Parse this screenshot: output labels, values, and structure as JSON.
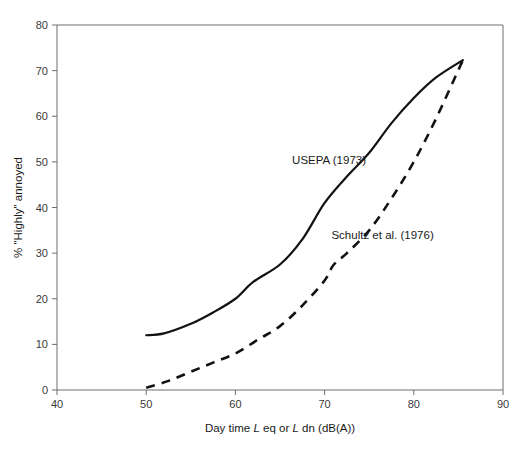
{
  "chart_data": {
    "type": "line",
    "title": "",
    "xlabel": "Day time L eq or L dn (dB(A))",
    "xlabel_parts": [
      {
        "text": "Day time ",
        "italic": false
      },
      {
        "text": "L",
        "italic": true
      },
      {
        "text": " eq or ",
        "italic": false
      },
      {
        "text": "L",
        "italic": true
      },
      {
        "text": " dn (dB(A))",
        "italic": false
      }
    ],
    "ylabel": "% \"Highly\" annoyed",
    "xlim": [
      40,
      90
    ],
    "ylim": [
      0,
      80
    ],
    "xticks": [
      40,
      50,
      60,
      70,
      80,
      90
    ],
    "yticks": [
      0,
      10,
      20,
      30,
      40,
      50,
      60,
      70,
      80
    ],
    "xtick_labels": [
      "40",
      "50",
      "60",
      "70",
      "80",
      "90"
    ],
    "ytick_labels": [
      "0",
      "10",
      "20",
      "30",
      "40",
      "50",
      "60",
      "70",
      "80"
    ],
    "grid": false,
    "legend_position": "inline-annotations",
    "series": [
      {
        "name": "USEPA (1973)",
        "style": "solid",
        "color": "#121212",
        "label_x": 70.5,
        "label_y": 49.5,
        "x": [
          50,
          52,
          55,
          57.5,
          60,
          62,
          65,
          67.5,
          70,
          72.5,
          75,
          77.5,
          80,
          82.5,
          85.5
        ],
        "y": [
          12,
          12.4,
          14.5,
          17,
          20,
          23.7,
          27.5,
          33,
          41,
          46.8,
          52,
          58.5,
          64,
          68.5,
          72.3
        ]
      },
      {
        "name": "Schultz et al. (1976)",
        "style": "dashed",
        "color": "#121212",
        "label_x": 76.5,
        "label_y": 33,
        "x": [
          50,
          52.5,
          55,
          57.5,
          60,
          62.5,
          65,
          67.5,
          70,
          71,
          72.5,
          75,
          77.5,
          80,
          82.5,
          85.5
        ],
        "y": [
          0.5,
          2,
          4,
          6,
          8,
          11,
          14,
          18.5,
          24,
          27.4,
          30,
          35,
          42,
          50,
          59.5,
          72.3
        ]
      }
    ]
  },
  "figure": {
    "background_color": "#ffffff",
    "axis_color": "#6e6e6e",
    "text_color": "#1a1a1a",
    "tick_text_color": "#3a3a3a"
  }
}
